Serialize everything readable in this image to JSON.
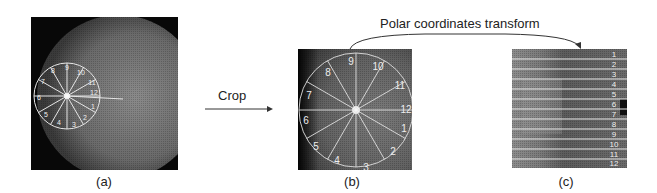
{
  "figure": {
    "panels": [
      {
        "id": "a",
        "caption": "(a)",
        "description": "Fundus image with sector grid overlay"
      },
      {
        "id": "b",
        "caption": "(b)",
        "description": "Cropped region with 12 sectors"
      },
      {
        "id": "c",
        "caption": "(c)",
        "description": "Polar-transformed strip with 12 rows"
      }
    ],
    "arrows": {
      "crop_label": "Crop",
      "polar_label": "Polar coordinates transform"
    },
    "sector_labels": [
      "1",
      "2",
      "3",
      "4",
      "5",
      "6",
      "7",
      "8",
      "9",
      "10",
      "11",
      "12"
    ],
    "row_labels": [
      "1",
      "2",
      "3",
      "4",
      "5",
      "6",
      "7",
      "8",
      "9",
      "10",
      "11",
      "12"
    ],
    "colors": {
      "background": "#ffffff",
      "image_dark": "#0a0a0a",
      "image_mid": "#6b6b6b",
      "grid_line": "#e8e8e8",
      "arrow": "#333333"
    }
  }
}
